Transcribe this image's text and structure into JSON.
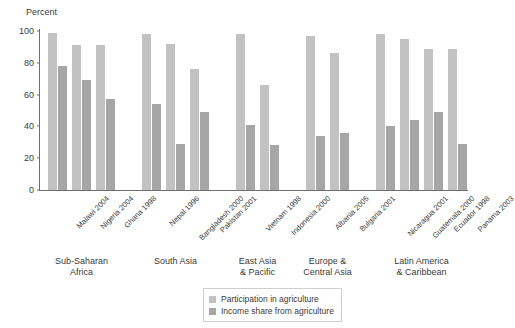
{
  "chart_data": {
    "type": "bar",
    "title": "",
    "subtitle": "",
    "xlabel": "",
    "ylabel": "Percent",
    "ylim": [
      0,
      100
    ],
    "yticks": [
      0,
      20,
      40,
      60,
      80,
      100
    ],
    "grid": false,
    "legend_position": "bottom-center",
    "categories": [
      "Malawi 2004",
      "Nigeria 2004",
      "Ghana 1998",
      "Nepal 1996",
      "Bangladesh 2000",
      "Pakistan 2001",
      "Vietnam 1998",
      "Indonesia 2000",
      "Albania 2005",
      "Bulgaria 2001",
      "Nicaragua 2001",
      "Guatemala 2000",
      "Ecuador 1998",
      "Panama 2003"
    ],
    "series": [
      {
        "name": "Participation in agriculture",
        "color": "#c2c2c2",
        "values": [
          99,
          91,
          91,
          98,
          92,
          76,
          98,
          66,
          97,
          86,
          98,
          95,
          89,
          89
        ]
      },
      {
        "name": "Income share from agriculture",
        "color": "#a6a6a6",
        "values": [
          78,
          69,
          57,
          54,
          29,
          49,
          41,
          28,
          34,
          36,
          40,
          44,
          49,
          29
        ]
      }
    ],
    "groups": [
      {
        "label": "Sub-Saharan\nAfrica",
        "count": 3
      },
      {
        "label": "South Asia",
        "count": 3
      },
      {
        "label": "East Asia\n& Pacific",
        "count": 2
      },
      {
        "label": "Europe &\nCentral Asia",
        "count": 2
      },
      {
        "label": "Latin America\n& Caribbean",
        "count": 4
      }
    ]
  },
  "legend": {
    "items": [
      {
        "label": "Participation in agriculture",
        "color": "#c2c2c2"
      },
      {
        "label": "Income share from agriculture",
        "color": "#a6a6a6"
      }
    ]
  }
}
